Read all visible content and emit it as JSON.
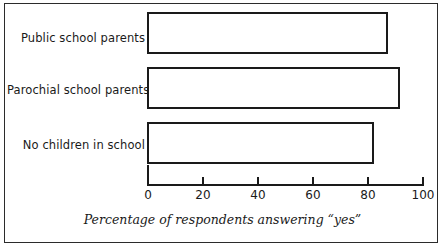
{
  "chart_data": {
    "type": "bar",
    "orientation": "horizontal",
    "title": "",
    "subtitle": "",
    "xlabel": "Percentage of respondents answering “yes”",
    "ylabel": "",
    "categories": [
      "Public school parents",
      "Parochial school parents",
      "No children in school"
    ],
    "values": [
      87.5,
      92,
      82.5
    ],
    "xlim": [
      0,
      100
    ],
    "xticks": [
      0,
      20,
      40,
      60,
      80,
      100
    ],
    "xtick_labels": [
      "0",
      "20",
      "40",
      "60",
      "80",
      "100"
    ],
    "grid": false,
    "legend": null,
    "series": [
      {
        "name": "Percentage answering yes",
        "values": [
          87.5,
          92,
          82.5
        ]
      }
    ],
    "bar_style": {
      "fill": "#ffffff",
      "stroke": "#1a1a1a",
      "stroke_width": 2
    },
    "annotations": []
  },
  "figure": {
    "frame_color": "#2b2b2b",
    "background": "#ffffff",
    "axis_color": "#1a1a1a"
  }
}
